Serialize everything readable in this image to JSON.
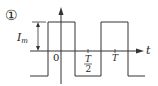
{
  "diagram": {
    "index_label": "①",
    "amplitude_label": "I",
    "amplitude_subscript": "m",
    "origin_label": "0",
    "half_period_numerator": "T",
    "half_period_denominator": "2",
    "period_label": "T",
    "axis_label": "t",
    "waveform": "square",
    "colors": {
      "stroke": "#333333",
      "background": "#ffffff"
    }
  }
}
